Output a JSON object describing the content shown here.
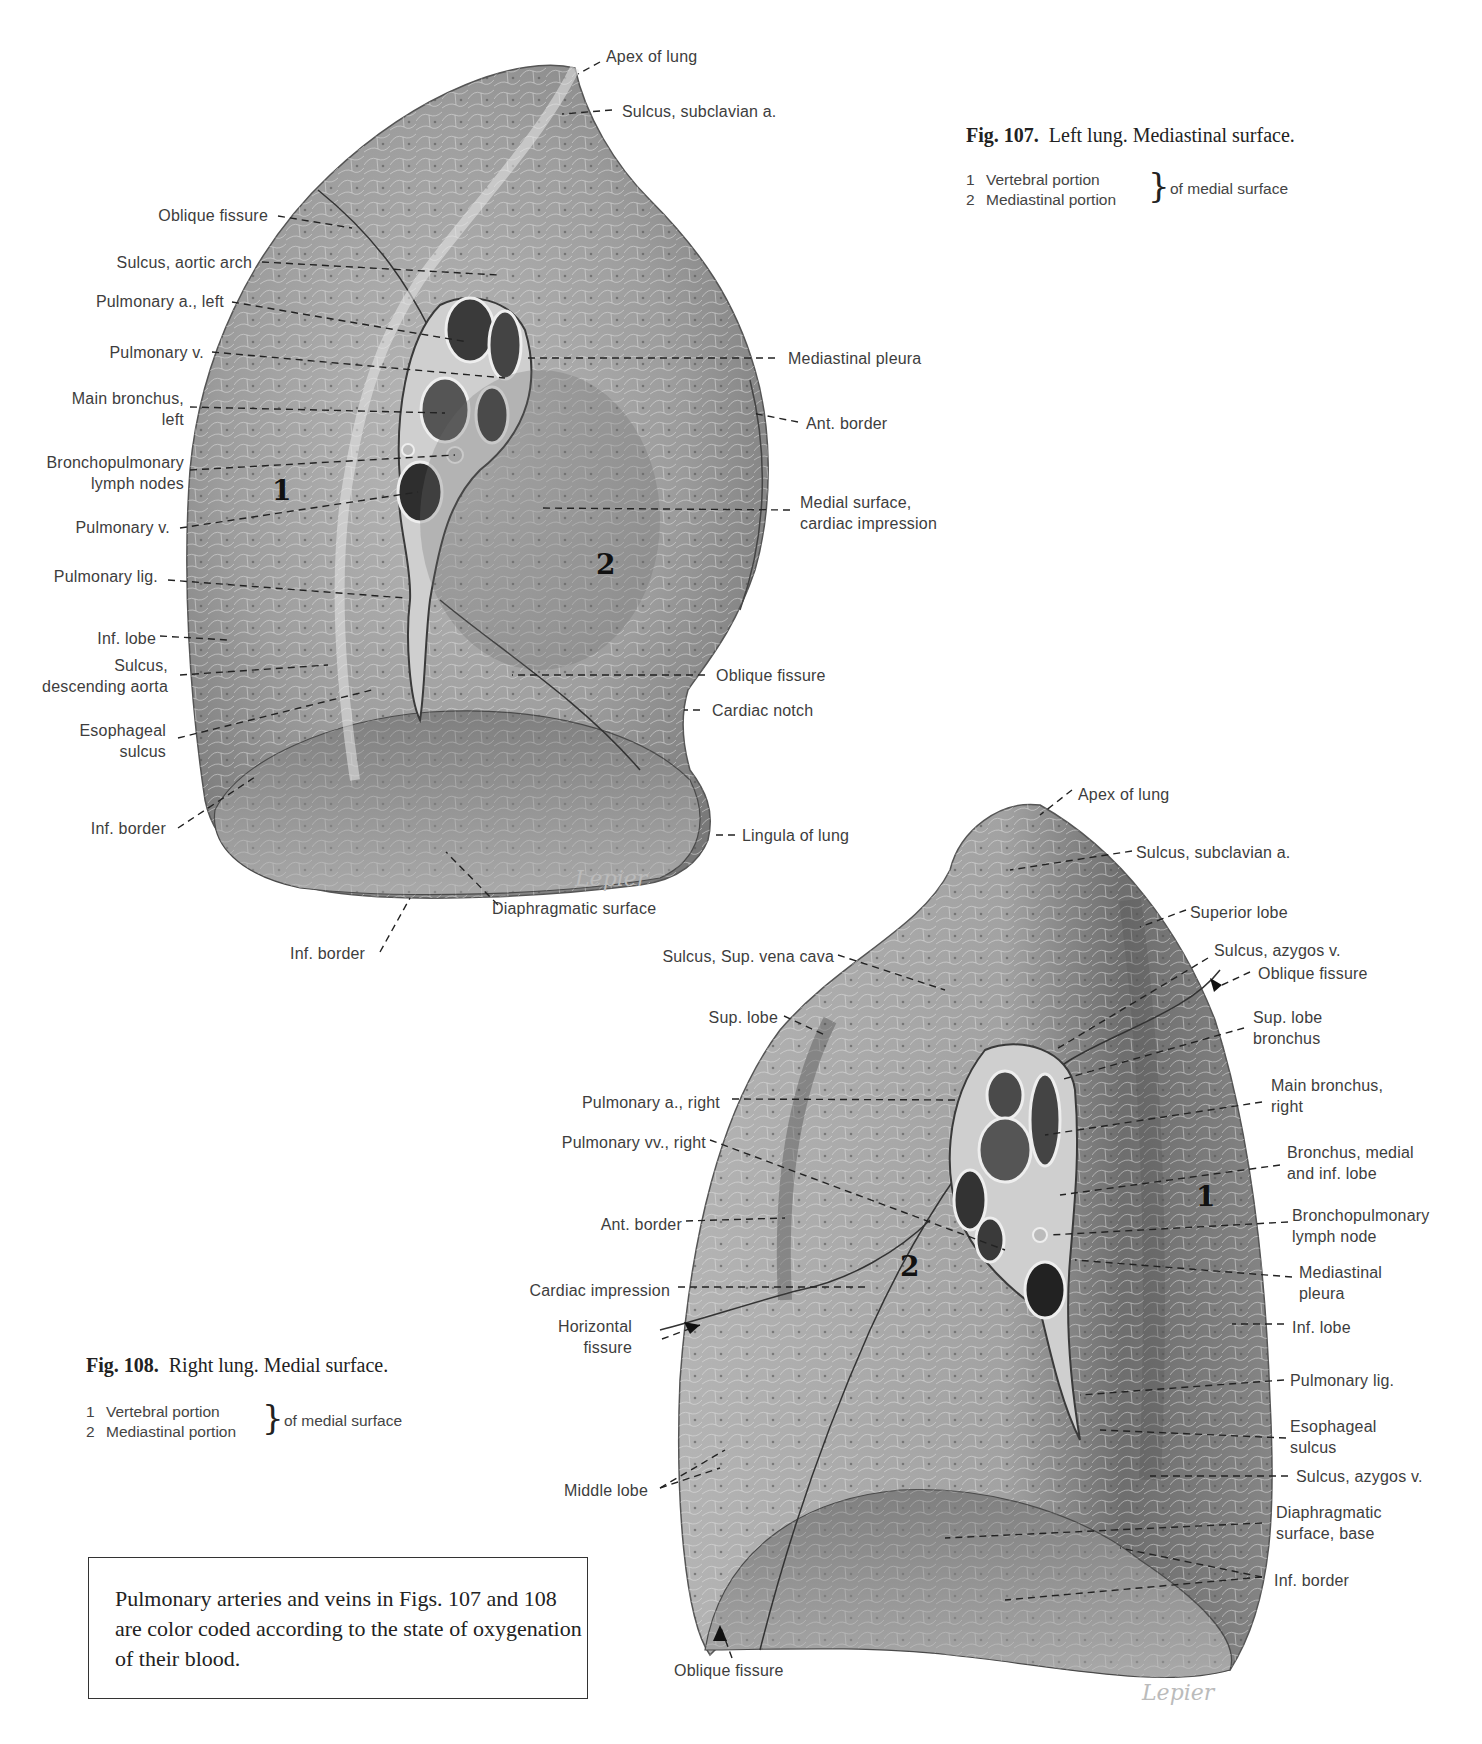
{
  "fig107": {
    "title_bold": "Fig. 107.",
    "title_rest": "Left lung. Mediastinal surface.",
    "legend": [
      {
        "num": "1",
        "text": "Vertebral portion"
      },
      {
        "num": "2",
        "text": "Mediastinal portion"
      }
    ],
    "legend_suffix": "of medial surface",
    "region_numbers": [
      "1",
      "2"
    ],
    "labels": {
      "apex": "Apex of lung",
      "sulcus_subclavian": "Sulcus, subclavian a.",
      "oblique_fissure_top": "Oblique fissure",
      "sulcus_aortic_arch": "Sulcus, aortic arch",
      "pulmonary_a_left": "Pulmonary a., left",
      "pulmonary_v_upper": "Pulmonary v.",
      "main_bronchus_left": "Main bronchus,\nleft",
      "bronchopulmonary_nodes": "Bronchopulmonary\nlymph nodes",
      "pulmonary_v_lower": "Pulmonary v.",
      "pulmonary_lig": "Pulmonary lig.",
      "inf_lobe": "Inf. lobe",
      "sulcus_desc_aorta": "Sulcus,\ndescending aorta",
      "esophageal_sulcus": "Esophageal\nsulcus",
      "inf_border_left": "Inf. border",
      "inf_border_bottom": "Inf. border",
      "diaphragmatic_surface": "Diaphragmatic surface",
      "mediastinal_pleura": "Mediastinal pleura",
      "ant_border": "Ant. border",
      "medial_surface_cardiac": "Medial surface,\ncardiac impression",
      "oblique_fissure_right": "Oblique fissure",
      "cardiac_notch": "Cardiac notch",
      "lingula": "Lingula of lung"
    }
  },
  "fig108": {
    "title_bold": "Fig. 108.",
    "title_rest": "Right lung. Medial surface.",
    "legend": [
      {
        "num": "1",
        "text": "Vertebral portion"
      },
      {
        "num": "2",
        "text": "Mediastinal portion"
      }
    ],
    "legend_suffix": "of medial surface",
    "region_numbers": [
      "1",
      "2"
    ],
    "labels": {
      "apex": "Apex of lung",
      "sulcus_subclavian": "Sulcus, subclavian a.",
      "superior_lobe": "Superior lobe",
      "sulcus_azygos_top": "Sulcus, azygos v.",
      "oblique_fissure_top": "Oblique fissure",
      "sup_lobe_bronchus": "Sup. lobe\nbronchus",
      "main_bronchus_right": "Main bronchus,\nright",
      "bronchus_medial_inf": "Bronchus, medial\nand inf. lobe",
      "bronchopulmonary_node": "Bronchopulmonary\nlymph node",
      "mediastinal_pleura": "Mediastinal\npleura",
      "inf_lobe": "Inf. lobe",
      "pulmonary_lig": "Pulmonary lig.",
      "esophageal_sulcus": "Esophageal\nsulcus",
      "sulcus_azygos_bottom": "Sulcus, azygos v.",
      "diaphragmatic_base": "Diaphragmatic\nsurface, base",
      "inf_border": "Inf. border",
      "sulcus_svc": "Sulcus, Sup. vena cava",
      "sup_lobe": "Sup. lobe",
      "pulmonary_a_right": "Pulmonary a., right",
      "pulmonary_vv_right": "Pulmonary vv., right",
      "ant_border": "Ant. border",
      "cardiac_impression": "Cardiac impression",
      "horizontal_fissure": "Horizontal\nfissure",
      "middle_lobe": "Middle lobe",
      "oblique_fissure_bottom": "Oblique fissure"
    }
  },
  "note": "Pulmonary arteries and veins in Figs. 107 and 108 are color coded according to the state of oxygenation of their blood.",
  "signatures": [
    "Lepier",
    "Lepier"
  ]
}
